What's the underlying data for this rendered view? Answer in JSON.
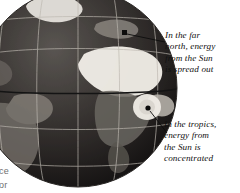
{
  "figure": {
    "kind": "earth-globe-insolation-diagram",
    "background": "#ffffff",
    "palette": {
      "ocean_dark": "#231f20",
      "land_mid": "#6e6a66",
      "highlight": "#f2f0ec",
      "graticule": "#b9b5ad",
      "ray_grey": "#9a9a9a",
      "leader": "#111111",
      "text": "#111111",
      "clipped_text": "#6f6f6f"
    },
    "globe": {
      "center_x": 78,
      "center_y": 88,
      "radius": 99,
      "cropped_edges": [
        "left",
        "top"
      ],
      "features": [
        "equator-line",
        "latitude-lines",
        "longitude-lines",
        "africa",
        "europe",
        "south-america",
        "greenland",
        "sahara-highlight"
      ]
    },
    "sun_rays": {
      "direction": "horizontal",
      "count": 12,
      "from": "right edge",
      "note": "parallel beams of sunlight striking the globe"
    }
  },
  "annotations": [
    {
      "id": "north",
      "marker": {
        "x": 125,
        "y": 33,
        "shape": "square"
      },
      "leader": {
        "x1": 129,
        "y1": 35,
        "x2": 164,
        "y2": 41
      },
      "lines": [
        "In the far",
        "north, energy",
        "from the Sun",
        "is spread out"
      ]
    },
    {
      "id": "tropics",
      "marker": {
        "x": 149,
        "y": 109,
        "shape": "dot"
      },
      "leader": {
        "x1": 151,
        "y1": 112,
        "x2": 166,
        "y2": 132
      },
      "lines": [
        "In the tropics,",
        "energy from",
        "the Sun is",
        "concentrated"
      ]
    }
  ],
  "clipped_labels": {
    "line_a": "ce",
    "line_b": "or"
  }
}
